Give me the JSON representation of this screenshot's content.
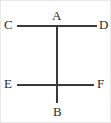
{
  "figure": {
    "type": "line-diagram",
    "width": 111,
    "height": 123,
    "background_color": "#ffffff",
    "stroke_color": "#3a3a3a",
    "label_color": "#2b2b2b",
    "border_color": "#e8e8e8"
  },
  "points": {
    "a": "A",
    "b": "B",
    "c": "C",
    "d": "D",
    "e": "E",
    "f": "F"
  },
  "segments": [
    {
      "name": "AB",
      "from": "A",
      "to": "B",
      "orientation": "vertical"
    },
    {
      "name": "CD",
      "from": "C",
      "to": "D",
      "orientation": "horizontal"
    },
    {
      "name": "EF",
      "from": "E",
      "to": "F",
      "orientation": "horizontal"
    }
  ]
}
